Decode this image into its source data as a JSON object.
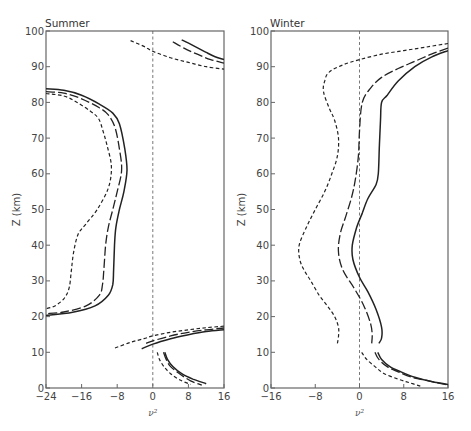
{
  "chart_data": [
    {
      "type": "line",
      "title": "Summer",
      "xlabel": "ν²",
      "ylabel": "Z (km)",
      "xlim": [
        -24,
        16
      ],
      "ylim": [
        0,
        100
      ],
      "xticks": [
        -24,
        -16,
        -8,
        0,
        8,
        16
      ],
      "yticks": [
        0,
        10,
        20,
        30,
        40,
        50,
        60,
        70,
        80,
        90,
        100
      ],
      "grid": false,
      "zero_line": true,
      "series": [
        {
          "name": "solid",
          "style": "solid",
          "segments": [
            [
              [
                -24,
                83.8
              ],
              [
                -20,
                83.4
              ],
              [
                -16,
                82
              ],
              [
                -12,
                79.5
              ],
              [
                -9,
                77
              ],
              [
                -7.5,
                74
              ],
              [
                -6.3,
                67
              ],
              [
                -5.8,
                61
              ],
              [
                -6.5,
                55
              ],
              [
                -7.5,
                50
              ],
              [
                -8.3,
                45
              ],
              [
                -8.6,
                40
              ],
              [
                -8.8,
                33
              ],
              [
                -9,
                29
              ],
              [
                -10,
                26
              ],
              [
                -13,
                23
              ],
              [
                -18,
                21.2
              ],
              [
                -24,
                20.3
              ]
            ],
            [
              [
                6.5,
                97.5
              ],
              [
                9,
                96
              ],
              [
                12,
                94
              ],
              [
                14,
                92.8
              ],
              [
                16,
                92
              ]
            ],
            [
              [
                -2.5,
                11
              ],
              [
                0,
                12.3
              ],
              [
                4,
                13.8
              ],
              [
                8,
                14.9
              ],
              [
                12,
                15.8
              ],
              [
                16,
                16.3
              ]
            ],
            [
              [
                2.7,
                10
              ],
              [
                3.3,
                8
              ],
              [
                4.5,
                6
              ],
              [
                6.5,
                4
              ],
              [
                9,
                2.5
              ],
              [
                12,
                1.2
              ]
            ]
          ]
        },
        {
          "name": "long-dashed",
          "style": "long-dash",
          "segments": [
            [
              [
                -24,
                83
              ],
              [
                -20,
                82.6
              ],
              [
                -16,
                81
              ],
              [
                -12,
                78.5
              ],
              [
                -10,
                76.5
              ],
              [
                -8.5,
                73
              ],
              [
                -7.5,
                67
              ],
              [
                -7,
                61
              ],
              [
                -8,
                55
              ],
              [
                -9,
                50
              ],
              [
                -10,
                45
              ],
              [
                -10.6,
                40
              ],
              [
                -11,
                33
              ],
              [
                -11.3,
                29
              ],
              [
                -12,
                26
              ],
              [
                -15,
                23
              ],
              [
                -20,
                21.3
              ],
              [
                -24,
                20.8
              ]
            ],
            [
              [
                4.5,
                97
              ],
              [
                7,
                95.2
              ],
              [
                10,
                93.5
              ],
              [
                13,
                92
              ],
              [
                16,
                91
              ]
            ],
            [
              [
                -1.5,
                12.5
              ],
              [
                0,
                13.2
              ],
              [
                4,
                14.6
              ],
              [
                8,
                15.6
              ],
              [
                12,
                16.3
              ],
              [
                16,
                16.8
              ]
            ],
            [
              [
                2.4,
                10
              ],
              [
                3,
                8
              ],
              [
                4,
                6
              ],
              [
                6,
                4
              ],
              [
                8.5,
                2
              ],
              [
                11,
                0.8
              ]
            ]
          ]
        },
        {
          "name": "short-dashed",
          "style": "short-dash",
          "segments": [
            [
              [
                -24,
                82.5
              ],
              [
                -20,
                81.8
              ],
              [
                -17,
                80
              ],
              [
                -14,
                77.5
              ],
              [
                -12.2,
                75.5
              ],
              [
                -11.2,
                72
              ],
              [
                -10.3,
                68
              ],
              [
                -9.3,
                62
              ],
              [
                -10,
                56
              ],
              [
                -12.5,
                50
              ],
              [
                -15,
                46
              ],
              [
                -16.8,
                43
              ],
              [
                -17.8,
                38
              ],
              [
                -18.3,
                33
              ],
              [
                -18.8,
                28
              ],
              [
                -20,
                25
              ],
              [
                -22,
                23
              ],
              [
                -24,
                22.2
              ]
            ],
            [
              [
                -5,
                97.3
              ],
              [
                -2,
                95.7
              ],
              [
                0,
                94.3
              ],
              [
                4,
                92.5
              ],
              [
                8,
                91.2
              ],
              [
                12,
                90
              ],
              [
                16,
                89.3
              ]
            ],
            [
              [
                -8.5,
                11.2
              ],
              [
                -5,
                12.8
              ],
              [
                -2,
                13.8
              ],
              [
                0,
                14.6
              ],
              [
                4,
                15.6
              ],
              [
                8,
                16.3
              ],
              [
                12,
                16.9
              ],
              [
                16,
                17.3
              ]
            ],
            [
              [
                1,
                10
              ],
              [
                1.5,
                8
              ],
              [
                2.5,
                6
              ],
              [
                4,
                4
              ],
              [
                6,
                2.3
              ],
              [
                8.5,
                1
              ]
            ]
          ]
        }
      ]
    },
    {
      "type": "line",
      "title": "Winter",
      "xlabel": "ν²",
      "ylabel": "Z (km)",
      "xlim": [
        -16,
        16
      ],
      "ylim": [
        0,
        100
      ],
      "xticks": [
        -16,
        -8,
        0,
        8,
        16
      ],
      "yticks": [
        0,
        10,
        20,
        30,
        40,
        50,
        60,
        70,
        80,
        90,
        100
      ],
      "grid": false,
      "zero_line": true,
      "series": [
        {
          "name": "solid",
          "style": "solid",
          "segments": [
            [
              [
                16,
                94.5
              ],
              [
                13,
                92.7
              ],
              [
                10,
                90
              ],
              [
                7,
                86
              ],
              [
                5,
                82
              ],
              [
                4,
                80
              ],
              [
                3.8,
                75
              ],
              [
                3.6,
                68
              ],
              [
                3.4,
                60
              ],
              [
                3,
                57
              ],
              [
                1.5,
                53
              ],
              [
                0.5,
                49
              ],
              [
                -0.5,
                45
              ],
              [
                -1.3,
                40
              ],
              [
                -1.2,
                36
              ],
              [
                0,
                31
              ],
              [
                1.5,
                27
              ],
              [
                3,
                22
              ],
              [
                4,
                17
              ],
              [
                4,
                14
              ],
              [
                3.5,
                12.5
              ]
            ],
            [
              [
                3.3,
                10
              ],
              [
                4,
                8
              ],
              [
                5.5,
                6
              ],
              [
                7.5,
                4.5
              ],
              [
                10,
                3
              ],
              [
                13,
                1.8
              ],
              [
                16,
                1
              ]
            ]
          ]
        },
        {
          "name": "long-dashed",
          "style": "long-dash",
          "segments": [
            [
              [
                16,
                95.2
              ],
              [
                13,
                93.5
              ],
              [
                10,
                91.5
              ],
              [
                7,
                89.5
              ],
              [
                4,
                87
              ],
              [
                2,
                84
              ],
              [
                0.5,
                80
              ],
              [
                0,
                72
              ],
              [
                -0.2,
                65
              ],
              [
                -0.8,
                58
              ],
              [
                -1.5,
                53
              ],
              [
                -2.5,
                48
              ],
              [
                -3.5,
                43
              ],
              [
                -3.8,
                38
              ],
              [
                -3,
                33
              ],
              [
                -1,
                28
              ],
              [
                0.8,
                23
              ],
              [
                2,
                18
              ],
              [
                2.3,
                15
              ],
              [
                2.2,
                12.5
              ]
            ],
            [
              [
                2.8,
                10
              ],
              [
                3.5,
                8
              ],
              [
                5,
                6
              ],
              [
                7,
                4.5
              ],
              [
                9.5,
                3
              ],
              [
                12.5,
                2
              ],
              [
                16,
                0.8
              ]
            ]
          ]
        },
        {
          "name": "short-dashed",
          "style": "short-dash",
          "segments": [
            [
              [
                16,
                96.5
              ],
              [
                12,
                95.5
              ],
              [
                8,
                94.5
              ],
              [
                4,
                93.5
              ],
              [
                0,
                92
              ],
              [
                -3,
                90.5
              ],
              [
                -5.5,
                88.5
              ],
              [
                -6.3,
                86
              ],
              [
                -6.5,
                83
              ],
              [
                -5.5,
                78.5
              ],
              [
                -4.5,
                75
              ],
              [
                -3.8,
                70
              ],
              [
                -4,
                65
              ],
              [
                -5,
                60
              ],
              [
                -6.3,
                55
              ],
              [
                -8,
                50
              ],
              [
                -9.6,
                45
              ],
              [
                -10.9,
                40
              ],
              [
                -10.8,
                36
              ],
              [
                -10,
                33
              ],
              [
                -8.8,
                30
              ],
              [
                -7.3,
                26
              ],
              [
                -5.8,
                23
              ],
              [
                -4.5,
                20
              ],
              [
                -3.8,
                17
              ],
              [
                -3.8,
                14.5
              ],
              [
                -4,
                12.5
              ]
            ],
            [
              [
                0.4,
                10
              ],
              [
                1.3,
                8
              ],
              [
                2.8,
                6
              ],
              [
                4.5,
                4
              ],
              [
                7,
                2.5
              ],
              [
                9,
                1.5
              ],
              [
                11,
                0.5
              ]
            ]
          ]
        }
      ]
    }
  ],
  "panels": {
    "summer": {
      "title": "Summer",
      "xlabel": "ν²",
      "ylabel": "Z (km)"
    },
    "winter": {
      "title": "Winter",
      "xlabel": "ν²",
      "ylabel": "Z (km)"
    }
  }
}
